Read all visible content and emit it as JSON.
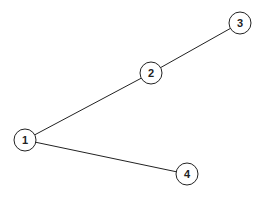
{
  "diagram": {
    "type": "undirected-graph",
    "width": 268,
    "height": 199,
    "node_radius": 11,
    "colors": {
      "stroke": "#222222",
      "fill": "#ffffff",
      "background": "#ffffff"
    },
    "nodes": [
      {
        "id": "1",
        "label": "1",
        "x": 25,
        "y": 140
      },
      {
        "id": "2",
        "label": "2",
        "x": 151,
        "y": 73
      },
      {
        "id": "3",
        "label": "3",
        "x": 240,
        "y": 23
      },
      {
        "id": "4",
        "label": "4",
        "x": 187,
        "y": 174
      }
    ],
    "edges": [
      {
        "from": "1",
        "to": "2"
      },
      {
        "from": "2",
        "to": "3"
      },
      {
        "from": "1",
        "to": "4"
      }
    ]
  }
}
